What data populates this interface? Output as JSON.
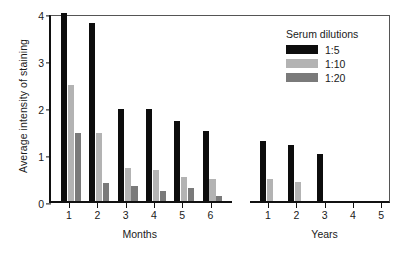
{
  "chart_data": {
    "type": "bar",
    "title": "",
    "xlabel": "",
    "ylabel": "Average intensity of staining",
    "ylim": [
      0,
      4
    ],
    "yticks": [
      0,
      1,
      2,
      3,
      4
    ],
    "grid": false,
    "legend_position": "top-right",
    "legend_title": "Serum dilutions",
    "axis_break": true,
    "groups": [
      {
        "name": "Months",
        "categories": [
          "1",
          "2",
          "3",
          "4",
          "5",
          "6"
        ]
      },
      {
        "name": "Years",
        "categories": [
          "1",
          "2",
          "3",
          "4",
          "5"
        ]
      }
    ],
    "categories": [
      "Months 1",
      "Months 2",
      "Months 3",
      "Months 4",
      "Months 5",
      "Months 6",
      "Years 1",
      "Years 2",
      "Years 3",
      "Years 4",
      "Years 5"
    ],
    "series": [
      {
        "name": "1:5",
        "color": "#0d0d0d",
        "values": [
          4.0,
          3.79,
          1.96,
          1.96,
          1.7,
          1.5,
          1.27,
          1.2,
          1.0,
          0,
          0
        ]
      },
      {
        "name": "1:10",
        "color": "#b3b3b3",
        "values": [
          2.47,
          1.45,
          0.7,
          0.65,
          0.52,
          0.46,
          0.46,
          0.4,
          0,
          0,
          0
        ]
      },
      {
        "name": "1:20",
        "color": "#7a7a7a",
        "values": [
          1.45,
          0.38,
          0.31,
          0.21,
          0.27,
          0.1,
          0,
          0,
          0,
          0,
          0
        ]
      }
    ]
  }
}
